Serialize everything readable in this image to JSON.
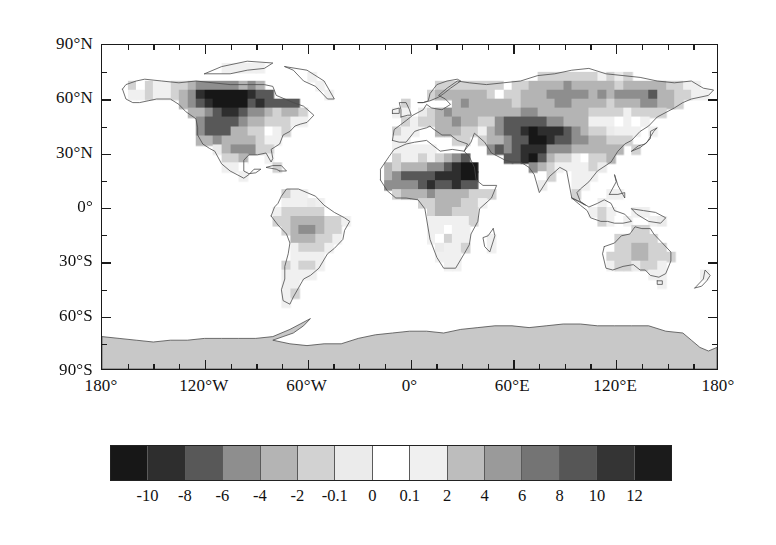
{
  "figure": {
    "type": "global-map-with-colorbar",
    "projection": "cylindrical-equidistant",
    "background_color": "#ffffff",
    "frame_color": "#1a1a1a",
    "coastline_color": "#4a4a4a",
    "masked_region_color": "#c8c8c8",
    "masked_region_name": "Antarctica"
  },
  "chart_data": {
    "type": "heatmap",
    "title": "",
    "xlabel": "",
    "ylabel": "",
    "xlim": [
      -180,
      180
    ],
    "ylim": [
      -90,
      90
    ],
    "grid": false,
    "legend_position": "bottom",
    "x_ticks": [
      {
        "value": -180,
        "label": "180°"
      },
      {
        "value": -120,
        "label": "120°W"
      },
      {
        "value": -60,
        "label": "60°W"
      },
      {
        "value": 0,
        "label": "0°"
      },
      {
        "value": 60,
        "label": "60°E"
      },
      {
        "value": 120,
        "label": "120°E"
      },
      {
        "value": 180,
        "label": "180°"
      }
    ],
    "x_minor_interval": 15,
    "y_ticks": [
      {
        "value": 90,
        "label": "90°N"
      },
      {
        "value": 60,
        "label": "60°N"
      },
      {
        "value": 30,
        "label": "30°N"
      },
      {
        "value": 0,
        "label": "0°"
      },
      {
        "value": -30,
        "label": "30°S"
      },
      {
        "value": -60,
        "label": "60°S"
      },
      {
        "value": -90,
        "label": "90°S"
      }
    ],
    "y_minor_interval": 15,
    "colorbar": {
      "orientation": "horizontal",
      "tick_labels": [
        "-10",
        "-8",
        "-6",
        "-4",
        "-2",
        "-0.1",
        "0",
        "0.1",
        "2",
        "4",
        "6",
        "8",
        "10",
        "12"
      ],
      "boundaries": [
        -10,
        -8,
        -6,
        -4,
        -2,
        -0.1,
        0,
        0.1,
        2,
        4,
        6,
        8,
        10,
        12
      ],
      "cell_count": 15,
      "cell_colors": [
        "#171717",
        "#2e2e2e",
        "#585858",
        "#8e8e8e",
        "#b4b4b4",
        "#d2d2d2",
        "#ebebeb",
        "#ffffff",
        "#f0f0f0",
        "#bdbdbd",
        "#9a9a9a",
        "#747474",
        "#565656",
        "#343434",
        "#1b1b1b"
      ],
      "diverging": true,
      "center_color": "#ffffff"
    },
    "data_grid": {
      "cell_size_degrees": 5,
      "ocean_value": null,
      "note": "land-only gridded anomaly values rendered as grayscale cells"
    }
  }
}
